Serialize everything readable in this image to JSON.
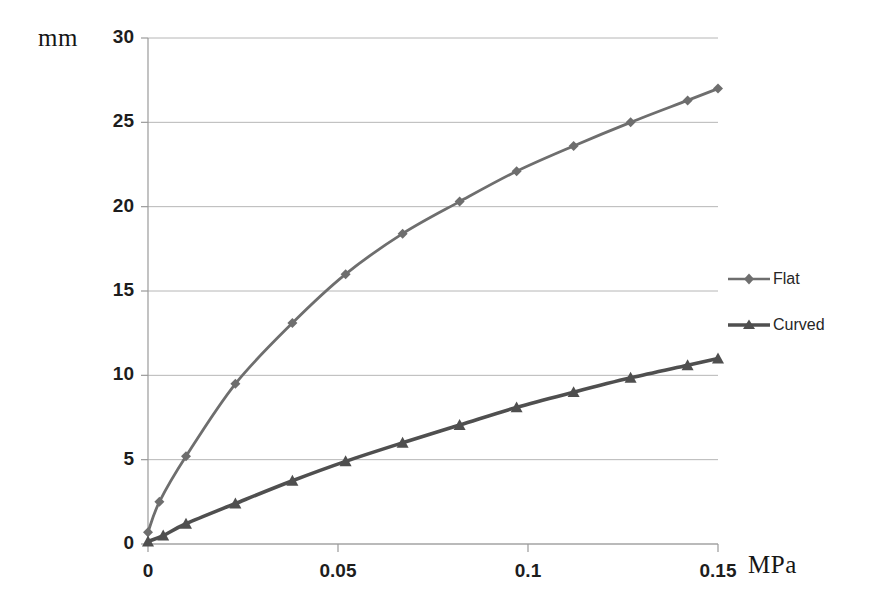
{
  "chart_data": {
    "type": "line",
    "title": "",
    "xlabel": "MPa",
    "ylabel": "mm",
    "xlim": [
      0,
      0.15
    ],
    "ylim": [
      0,
      30
    ],
    "grid": true,
    "legend_position": "right",
    "x_ticks": [
      "0",
      "0.05",
      "0.1",
      "0.15"
    ],
    "x_tick_values": [
      0,
      0.05,
      0.1,
      0.15
    ],
    "y_ticks": [
      "0",
      "5",
      "10",
      "15",
      "20",
      "25",
      "30"
    ],
    "y_tick_values": [
      0,
      5,
      10,
      15,
      20,
      25,
      30
    ],
    "series": [
      {
        "name": "Flat",
        "marker": "diamond",
        "color": "#6e6e6e",
        "x": [
          0,
          0.003,
          0.01,
          0.023,
          0.038,
          0.052,
          0.067,
          0.082,
          0.097,
          0.112,
          0.127,
          0.142,
          0.15
        ],
        "values": [
          0.7,
          2.5,
          5.2,
          9.5,
          13.1,
          16.0,
          18.4,
          20.3,
          22.1,
          23.6,
          25.0,
          26.3,
          27.0
        ]
      },
      {
        "name": "Curved",
        "marker": "triangle",
        "color": "#4f4f4f",
        "x": [
          0,
          0.004,
          0.01,
          0.023,
          0.038,
          0.052,
          0.067,
          0.082,
          0.097,
          0.112,
          0.127,
          0.142,
          0.15
        ],
        "values": [
          0.15,
          0.5,
          1.2,
          2.4,
          3.75,
          4.9,
          6.0,
          7.05,
          8.1,
          9.0,
          9.85,
          10.6,
          11.0
        ]
      }
    ]
  },
  "legend": {
    "items": [
      {
        "label": "Flat"
      },
      {
        "label": "Curved"
      }
    ]
  },
  "axes": {
    "y_unit": "mm",
    "x_unit": "MPa"
  },
  "colors": {
    "flat": "#6e6e6e",
    "curved": "#4f4f4f",
    "grid": "#b6b6b6",
    "axis": "#9a9a9a",
    "text": "#1d1d1d"
  }
}
